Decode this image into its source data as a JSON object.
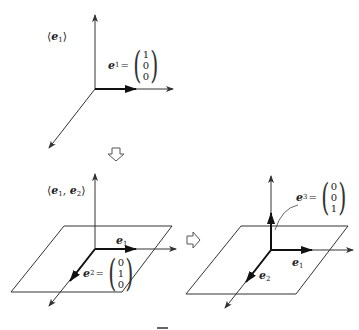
{
  "diagrams": [
    {
      "id": "span-e1",
      "span_label": "⟨e1⟩",
      "span_open": "⟨",
      "span_close": "⟩",
      "vectors": [
        {
          "name": "e",
          "sub": "1",
          "components": [
            "1",
            "0",
            "0"
          ]
        }
      ]
    },
    {
      "id": "span-e1-e2",
      "span_label": "⟨e1, e2⟩",
      "span_open": "⟨",
      "span_sep": ",",
      "span_close": "⟩",
      "vectors": [
        {
          "name": "e",
          "sub": "1",
          "components": []
        },
        {
          "name": "e",
          "sub": "2",
          "components": [
            "0",
            "1",
            "0"
          ]
        }
      ]
    },
    {
      "id": "span-e1-e2-e3",
      "vectors": [
        {
          "name": "e",
          "sub": "1",
          "components": []
        },
        {
          "name": "e",
          "sub": "2",
          "components": []
        },
        {
          "name": "e",
          "sub": "3",
          "components": [
            "0",
            "0",
            "1"
          ]
        }
      ]
    }
  ],
  "equals": "=",
  "arrows": {
    "down": "hollow-down-arrow",
    "right": "hollow-right-arrow"
  },
  "caption": "図"
}
